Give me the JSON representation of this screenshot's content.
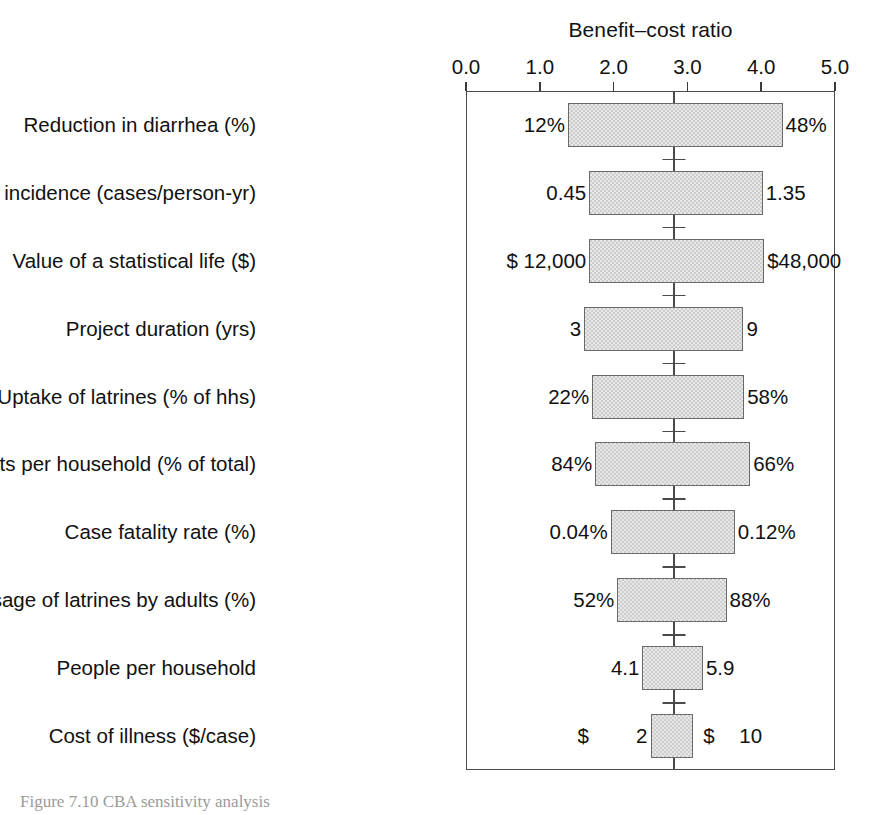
{
  "figure": {
    "axis_title": "Benefit–cost ratio",
    "caption": "Figure 7.10  CBA sensitivity analysis",
    "bar_fill_color": "#cdcdcd",
    "bar_border_color": "#6a6a6a",
    "frame_color": "#4a4a4a",
    "text_color": "#111111"
  },
  "chart_data": {
    "type": "bar",
    "subtype": "tornado",
    "title": "",
    "xlabel": "Benefit–cost ratio",
    "ylabel": "",
    "xlim": [
      0.0,
      5.0
    ],
    "xticks": [
      0.0,
      1.0,
      2.0,
      3.0,
      4.0,
      5.0
    ],
    "xticklabels": [
      "0.0",
      "1.0",
      "2.0",
      "3.0",
      "4.0",
      "5.0"
    ],
    "grid": false,
    "legend": null,
    "base_case": 2.82,
    "categories": [
      "Reduction in diarrhea (%)",
      "Diarrheal incidence (cases/person-yr)",
      "Value of a statistical life ($)",
      "Project duration (yrs)",
      "Uptake of latrines (% of hhs)",
      "Program costs per household (% of total)",
      "Case fatality rate (%)",
      "Usage of latrines by adults (%)",
      "People per household",
      "Cost of illness ($/case)"
    ],
    "bars": [
      {
        "category": "Reduction in diarrhea (%)",
        "low_ratio": 1.38,
        "high_ratio": 4.29,
        "low_label": "12%",
        "high_label": "48%",
        "low_prefix": "",
        "high_prefix": ""
      },
      {
        "category": "Diarrheal incidence (cases/person-yr)",
        "low_ratio": 1.67,
        "high_ratio": 4.02,
        "low_label": "0.45",
        "high_label": "1.35",
        "low_prefix": "",
        "high_prefix": ""
      },
      {
        "category": "Value of a statistical life ($)",
        "low_ratio": 1.67,
        "high_ratio": 4.04,
        "low_label": "$ 12,000",
        "high_label": "$48,000",
        "low_prefix": "",
        "high_prefix": ""
      },
      {
        "category": "Project duration (yrs)",
        "low_ratio": 1.6,
        "high_ratio": 3.76,
        "low_label": "3",
        "high_label": "9",
        "low_prefix": "",
        "high_prefix": ""
      },
      {
        "category": "Uptake of latrines (% of hhs)",
        "low_ratio": 1.71,
        "high_ratio": 3.77,
        "low_label": "22%",
        "high_label": "58%",
        "low_prefix": "",
        "high_prefix": ""
      },
      {
        "category": "Program costs per household (% of total)",
        "low_ratio": 1.75,
        "high_ratio": 3.85,
        "low_label": "84%",
        "high_label": "66%",
        "low_prefix": "",
        "high_prefix": ""
      },
      {
        "category": "Case fatality rate (%)",
        "low_ratio": 1.96,
        "high_ratio": 3.64,
        "low_label": "0.04%",
        "high_label": "0.12%",
        "low_prefix": "",
        "high_prefix": ""
      },
      {
        "category": "Usage of latrines by adults (%)",
        "low_ratio": 2.05,
        "high_ratio": 3.53,
        "low_label": "52%",
        "high_label": "88%",
        "low_prefix": "",
        "high_prefix": ""
      },
      {
        "category": "People per household",
        "low_ratio": 2.39,
        "high_ratio": 3.21,
        "low_label": "4.1",
        "high_label": "5.9",
        "low_prefix": "",
        "high_prefix": ""
      },
      {
        "category": "Cost of illness ($/case)",
        "low_ratio": 2.5,
        "high_ratio": 3.08,
        "low_label": "2",
        "high_label": "10",
        "low_prefix": "$",
        "high_prefix": "$"
      }
    ]
  }
}
